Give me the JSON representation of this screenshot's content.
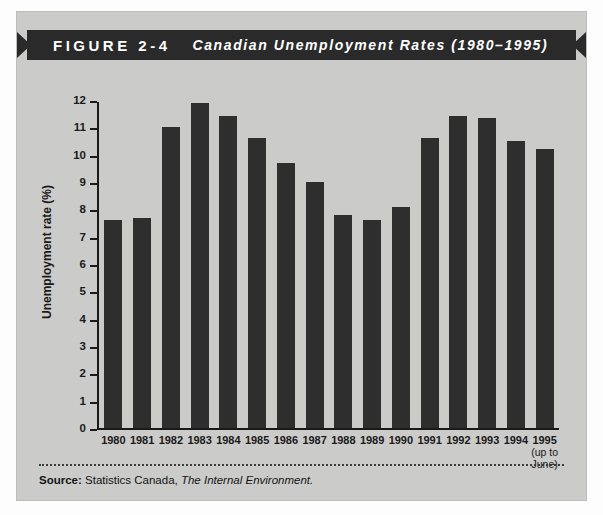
{
  "banner": {
    "figure_label": "FIGURE 2-4",
    "figure_title": "Canadian Unemployment Rates (1980–1995)"
  },
  "source_note": {
    "label": "Source:",
    "agency": "Statistics Canada,",
    "publication": "The Internal Environment."
  },
  "colors": {
    "banner_background": "#2a2a2a",
    "page_background": "#cbcbc9",
    "bar_fill": "#2e2e2e",
    "axis": "#1a1a1a",
    "text": "#141414"
  },
  "chart_data": {
    "type": "bar",
    "title": "Canadian Unemployment Rates (1980–1995)",
    "xlabel": "",
    "ylabel": "Unemployment rate (%)",
    "ylim": [
      0,
      12
    ],
    "ytick_step": 1,
    "yticks": [
      12,
      11,
      10,
      9,
      8,
      7,
      6,
      5,
      4,
      3,
      2,
      1,
      0
    ],
    "grid": false,
    "legend": null,
    "categories": [
      "1980",
      "1981",
      "1982",
      "1983",
      "1984",
      "1985",
      "1986",
      "1987",
      "1988",
      "1989",
      "1990",
      "1991",
      "1992",
      "1993",
      "1994",
      "1995"
    ],
    "category_sublabels": [
      "",
      "",
      "",
      "",
      "",
      "",
      "",
      "",
      "",
      "",
      "",
      "",
      "",
      "",
      "",
      "(up to\nJune)"
    ],
    "values": [
      7.6,
      7.7,
      11.0,
      11.9,
      11.4,
      10.6,
      9.7,
      9.0,
      7.8,
      7.6,
      8.1,
      10.6,
      11.4,
      11.35,
      10.5,
      10.2
    ]
  }
}
